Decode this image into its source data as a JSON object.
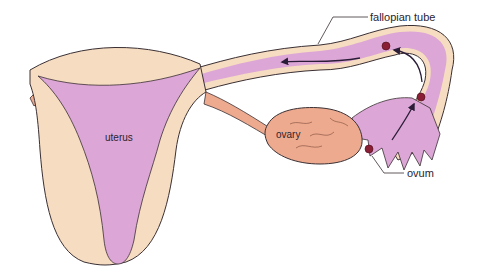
{
  "diagram": {
    "labels": {
      "uterus": "uterus",
      "ovary": "ovary",
      "fallopian_tube": "fallopian tube",
      "ovum": "ovum"
    },
    "colors": {
      "wall": "#f6dcc0",
      "cavity": "#dca6d6",
      "ovary": "#eeaa8e",
      "ovum": "#8a1e34",
      "outline": "#3a3034",
      "arrow": "#2b1d38",
      "background": "#ffffff"
    }
  }
}
